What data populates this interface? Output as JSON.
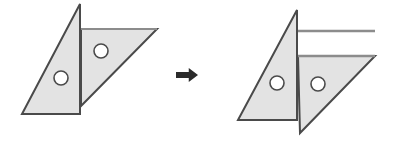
{
  "figure": {
    "canvas": {
      "width": 396,
      "height": 141,
      "background": "#ffffff"
    },
    "style": {
      "fill": "#e3e3e3",
      "stroke": "#4a4a4a",
      "stroke_light": "#8c8c8c",
      "stroke_width": 2,
      "hole_fill": "#ffffff",
      "arrow_color": "#2b2b2b"
    },
    "panels": [
      {
        "id": "before",
        "label": "before",
        "shapes": [
          {
            "name": "left-triangle",
            "type": "polygon",
            "points": "80,4 80,114 22,114"
          },
          {
            "name": "right-triangle",
            "type": "polygon",
            "points": "81,29 157,29 81,106"
          }
        ],
        "holes": [
          {
            "name": "hole-left",
            "cx": 61,
            "cy": 78,
            "r": 7
          },
          {
            "name": "hole-right",
            "cx": 101,
            "cy": 51,
            "r": 7
          }
        ]
      },
      {
        "id": "after",
        "label": "after",
        "shapes": [
          {
            "name": "left-triangle",
            "type": "polygon",
            "points": "297,10 297,120 238,120"
          },
          {
            "name": "right-triangle",
            "type": "polygon",
            "points": "298,56 375,56 300,133"
          }
        ],
        "lines": [
          {
            "name": "upper-guide-line",
            "x1": 297,
            "y1": 31,
            "x2": 375,
            "y2": 31
          },
          {
            "name": "lower-guide-line",
            "x1": 297,
            "y1": 56,
            "x2": 375,
            "y2": 56
          }
        ],
        "holes": [
          {
            "name": "hole-left",
            "cx": 277,
            "cy": 83,
            "r": 7
          },
          {
            "name": "hole-right",
            "cx": 318,
            "cy": 84,
            "r": 7
          }
        ]
      }
    ],
    "arrow": {
      "name": "transformation-arrow",
      "direction": "right",
      "x": 176,
      "y": 68,
      "width": 22,
      "height": 14
    }
  }
}
